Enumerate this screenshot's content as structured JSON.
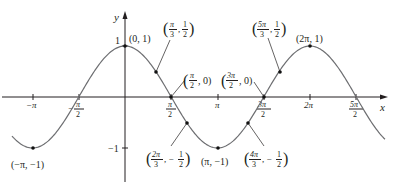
{
  "chart_data": {
    "type": "line",
    "title": "",
    "function": "y = cos x",
    "xlabel": "x",
    "ylabel": "y",
    "xlim": [
      -3.84,
      8.83
    ],
    "ylim": [
      -1,
      1
    ],
    "grid": false,
    "x_ticks": [
      {
        "value": -3.14159,
        "label_num": "−π",
        "label_den": ""
      },
      {
        "value": -1.5708,
        "label_num": "π",
        "label_den": "2",
        "sign": "−"
      },
      {
        "value": 1.5708,
        "label_num": "π",
        "label_den": "2"
      },
      {
        "value": 3.14159,
        "label_num": "π",
        "label_den": ""
      },
      {
        "value": 4.7124,
        "label_num": "3π",
        "label_den": "2"
      },
      {
        "value": 6.28319,
        "label_num": "2π",
        "label_den": ""
      },
      {
        "value": 7.85398,
        "label_num": "5π",
        "label_den": "2"
      }
    ],
    "y_ticks": [
      {
        "value": 1,
        "label": "1"
      },
      {
        "value": -1,
        "label": "−1"
      }
    ],
    "series": [
      {
        "name": "cos x",
        "points": [
          {
            "x": -3.14159,
            "y": -1,
            "label": "(−π, −1)"
          },
          {
            "x": 0,
            "y": 1,
            "label": "(0, 1)"
          },
          {
            "x": 1.0472,
            "y": 0.5,
            "label": "(π/3, 1/2)"
          },
          {
            "x": 1.5708,
            "y": 0,
            "label": "(π/2, 0)"
          },
          {
            "x": 2.0944,
            "y": -0.5,
            "label": "(2π/3, −1/2)"
          },
          {
            "x": 3.14159,
            "y": -1,
            "label": "(π, −1)"
          },
          {
            "x": 4.18879,
            "y": -0.5,
            "label": "(4π/3, −1/2)"
          },
          {
            "x": 4.7124,
            "y": 0,
            "label": "(3π/2, 0)"
          },
          {
            "x": 5.23599,
            "y": 0.5,
            "label": "(5π/3, 1/2)"
          },
          {
            "x": 6.28319,
            "y": 1,
            "label": "(2π, 1)"
          }
        ]
      }
    ],
    "annotations": {
      "p_neg_pi": {
        "text": "(−π, −1)"
      },
      "p_zero": {
        "text": "(0, 1)"
      },
      "p_pi3": {
        "open": "(",
        "num1": "π",
        "den1": "3",
        "sep": ",",
        "num2": "1",
        "den2": "2",
        "close": ")"
      },
      "p_pi2": {
        "open": "(",
        "num1": "π",
        "den1": "2",
        "tail": ", 0)"
      },
      "p_2pi3": {
        "open": "(",
        "num1": "2π",
        "den1": "3",
        "sep": ", −",
        "num2": "1",
        "den2": "2",
        "close": ")"
      },
      "p_pi": {
        "text": "(π, −1)"
      },
      "p_4pi3": {
        "open": "(",
        "num1": "4π",
        "den1": "3",
        "sep": ", −",
        "num2": "1",
        "den2": "2",
        "close": ")"
      },
      "p_3pi2": {
        "open": "(",
        "num1": "3π",
        "den1": "2",
        "tail": ", 0)"
      },
      "p_5pi3": {
        "open": "(",
        "num1": "5π",
        "den1": "3",
        "sep": ",",
        "num2": "1",
        "den2": "2",
        "close": ")"
      },
      "p_2pi": {
        "text": "(2π, 1)"
      }
    },
    "colors": {
      "curve": "#6d6e71",
      "axis": "#231f20",
      "points": "#111111"
    }
  }
}
